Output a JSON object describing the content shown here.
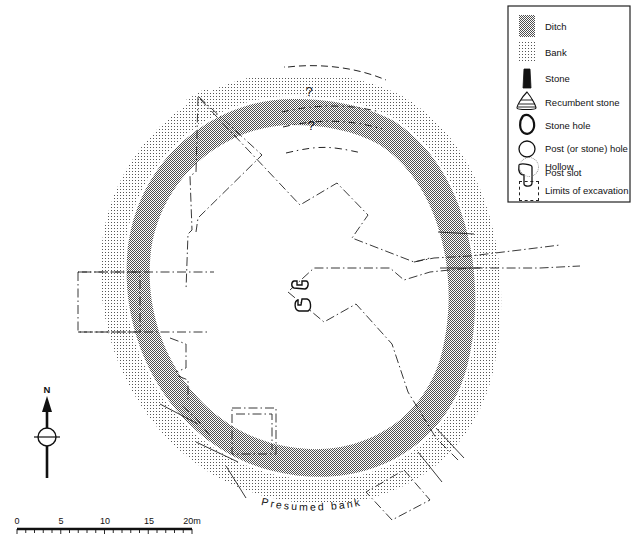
{
  "figure": {
    "kind": "archaeological-site-plan",
    "background_color": "#ffffff",
    "ink_color": "#111111"
  },
  "legend": {
    "border_color": "#222222",
    "items": [
      {
        "id": "ditch",
        "label": "Ditch",
        "swatch": "dense-checker-fill",
        "fill_color": "#8a8a8a"
      },
      {
        "id": "bank",
        "label": "Bank",
        "swatch": "sparse-dot-fill",
        "fill_color": "#b9b9b9"
      },
      {
        "id": "stone",
        "label": "Stone",
        "swatch": "solid-stone",
        "fill_color": "#111111"
      },
      {
        "id": "recumbent",
        "label": "Recumbent stone",
        "swatch": "banded-stone",
        "fill_color": "#111111"
      },
      {
        "id": "stonehole",
        "label": "Stone hole",
        "swatch": "thick-outline-blob",
        "fill_color": "#111111"
      },
      {
        "id": "posthole",
        "label": "Post (or stone) hole",
        "swatch": "open-circle",
        "fill_color": "#111111"
      },
      {
        "id": "postslot",
        "label": "Post slot",
        "swatch": "hook-outline",
        "fill_color": "#111111"
      },
      {
        "id": "hollow",
        "label": "Hollow",
        "swatch": "dotted-circle",
        "fill_color": "#888888"
      },
      {
        "id": "excav",
        "label": "Limits of excavation",
        "swatch": "dashdot-rectangle",
        "fill_color": "#222222"
      }
    ]
  },
  "north_arrow": {
    "label": "N"
  },
  "scale_bar": {
    "ticks": [
      "0",
      "5",
      "10",
      "15",
      "20m"
    ],
    "tick_values": [
      0,
      5,
      10,
      15,
      20
    ],
    "unit": "m",
    "minor_interval": 1,
    "length_px": 175
  },
  "annotations": {
    "presumed_bank": "Presumed bank",
    "query_top": "?",
    "query_lower": "?"
  },
  "map_features": {
    "ditch_ring": {
      "name": "ditch",
      "type": "annulus-arc",
      "fill": "#8a8a8a",
      "gap_description": "entrance causeway at north-north-east"
    },
    "bank_ring": {
      "name": "bank",
      "type": "annulus-arc",
      "fill": "#b9b9b9",
      "gap_description": "entrance causeway at north-north-east"
    },
    "internal_features": [
      {
        "id": "post-slot-upper",
        "type": "post-slot"
      },
      {
        "id": "post-slot-lower",
        "type": "post-slot"
      }
    ],
    "excavation_trenches_count": 9,
    "projected_lines_count": 4
  }
}
